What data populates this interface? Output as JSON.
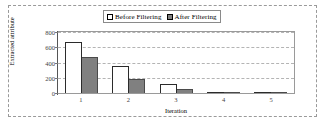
{
  "chart_data": {
    "type": "bar",
    "title": "",
    "xlabel": "Iteration",
    "ylabel": "Extracted attribute",
    "categories": [
      "1",
      "2",
      "3",
      "4",
      "5"
    ],
    "series": [
      {
        "name": "Before Filtering",
        "values": [
          675,
          360,
          120,
          15,
          3
        ],
        "color": "#ffffff",
        "edge_color": "#2b2b2b"
      },
      {
        "name": "After Filtering",
        "values": [
          470,
          185,
          50,
          10,
          0
        ],
        "color": "#808080",
        "edge_color": "#4a4a4a"
      }
    ],
    "ylim": [
      0,
      800
    ],
    "yticks": [
      0,
      200,
      400,
      600,
      800
    ],
    "ytick_labels": [
      "0",
      "200",
      "400",
      "600",
      "800"
    ],
    "grid": true,
    "grid_style": "dashed",
    "grid_color": "#b4b4b4",
    "legend_position": "top-center",
    "figure_border": "dashed"
  },
  "legend": {
    "entries": [
      {
        "label": "Before Filtering",
        "marker": "open-square-marker"
      },
      {
        "label": "After Filtering",
        "marker": "filled-square-marker"
      }
    ]
  }
}
